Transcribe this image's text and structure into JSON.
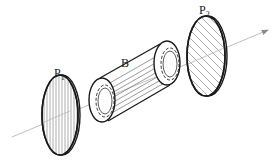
{
  "diagram": {
    "title": "",
    "labels": {
      "polarizer1": {
        "main": "P",
        "sub": "1"
      },
      "tube": "B",
      "polarizer2": {
        "main": "P",
        "sub": "2"
      }
    },
    "elements": [
      {
        "id": "polarizer1",
        "type": "disc",
        "hatch": "vertical"
      },
      {
        "id": "tube",
        "type": "cylinder",
        "fill": "horizontal-lines"
      },
      {
        "id": "polarizer2",
        "type": "disc",
        "hatch": "diagonal"
      },
      {
        "id": "light-ray",
        "type": "arrow",
        "direction": "left-to-right"
      }
    ],
    "colors": {
      "line": "#1a1a1a",
      "ray": "#b0b0b0",
      "background": "#ffffff"
    }
  }
}
